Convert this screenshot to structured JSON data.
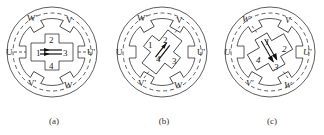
{
  "figure": {
    "panels": [
      {
        "caption": "(a)",
        "rotor_angle_deg": 0,
        "stator_labels": {
          "top_left": "W'",
          "top_right": "V",
          "left": "U",
          "right": "U'",
          "bottom_left": "V'",
          "bottom_right": "W"
        },
        "rotor_labels": [
          "1",
          "2",
          "3",
          "4"
        ],
        "aligned_phase": "U"
      },
      {
        "caption": "(b)",
        "rotor_angle_deg": -45,
        "stator_labels": {
          "top_left": "W'",
          "top_right": "V",
          "left": "U",
          "right": "U'",
          "bottom_left": "V'",
          "bottom_right": "W"
        },
        "rotor_labels": [
          "1",
          "2",
          "3",
          "4"
        ],
        "aligned_phase": "V"
      },
      {
        "caption": "(c)",
        "rotor_angle_deg": -60,
        "stator_labels": {
          "top_left": "W'",
          "top_right": "V",
          "left": "U",
          "right": "U'",
          "bottom_left": "V'",
          "bottom_right": "W"
        },
        "rotor_labels": [
          "1",
          "2",
          "3",
          "4"
        ],
        "aligned_phase": "W"
      }
    ],
    "colors": {
      "line": "#333333",
      "background": "#ffffff"
    }
  }
}
